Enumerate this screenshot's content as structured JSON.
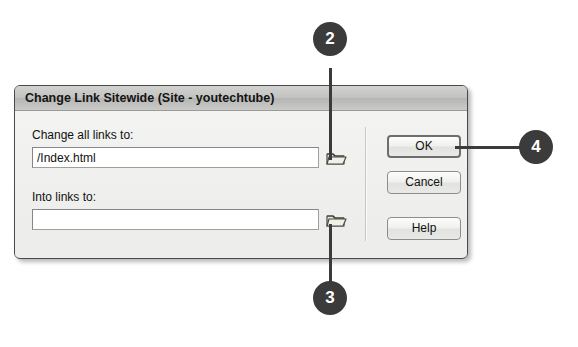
{
  "dialog": {
    "title": "Change Link Sitewide (Site - youtechtube)",
    "fields": [
      {
        "label": "Change all links to:",
        "value": "/Index.html",
        "placeholder": "",
        "browse_icon": "folder-icon"
      },
      {
        "label": "Into links to:",
        "value": "",
        "placeholder": "",
        "browse_icon": "folder-icon"
      }
    ],
    "buttons": [
      {
        "label": "OK",
        "default": true
      },
      {
        "label": "Cancel",
        "default": false
      },
      {
        "label": "Help",
        "default": false
      }
    ]
  },
  "callouts": [
    {
      "number": "2"
    },
    {
      "number": "3"
    },
    {
      "number": "4"
    }
  ],
  "colors": {
    "callout": "#3b3b3b",
    "dialog_body": "#eeeeec",
    "titlebar": "#c2c2c0",
    "input_background": "#ffffff",
    "border": "#4a4a4a"
  }
}
